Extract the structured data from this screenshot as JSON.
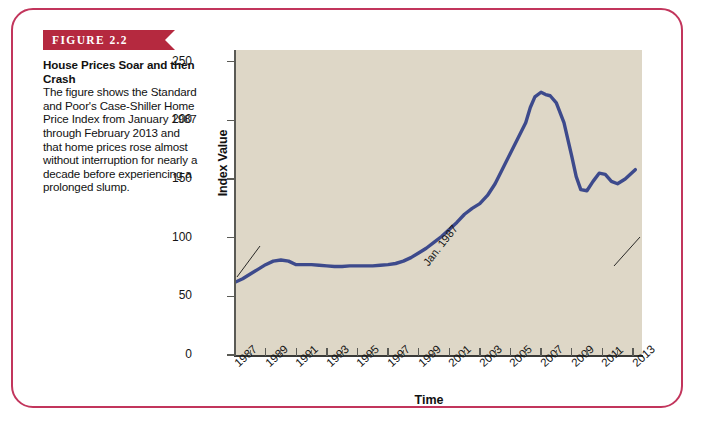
{
  "figure": {
    "banner_label": "FIGURE 2.2",
    "title": "House Prices Soar and then Crash",
    "body": "The figure shows the Standard and Poor's Case-Shiller Home Price Index from January 1987 through February 2013 and that home prices rose almost without interruption for nearly a decade before experiencing a prolonged slump."
  },
  "colors": {
    "banner": "#b5293f",
    "frame": "#c2355c",
    "plot_background": "#ded7c7",
    "line": "#3d4a8c",
    "axis": "#3a3a38",
    "text": "#111111"
  },
  "chart_data": {
    "type": "line",
    "title": "House Prices Soar and then Crash",
    "xlabel": "Time",
    "ylabel": "Index Value",
    "xlim": [
      1987,
      2013.6
    ],
    "ylim": [
      0,
      260
    ],
    "yticks": [
      0,
      50,
      100,
      150,
      200,
      250
    ],
    "xticks": [
      1987,
      1989,
      1991,
      1993,
      1995,
      1997,
      1999,
      2001,
      2003,
      2005,
      2007,
      2009,
      2011,
      2013
    ],
    "grid": false,
    "legend": "none",
    "series": [
      {
        "name": "S&P/Case-Shiller Home Price Index",
        "x": [
          1987.0,
          1987.5,
          1988.0,
          1988.5,
          1989.0,
          1989.5,
          1990.0,
          1990.5,
          1991.0,
          1991.5,
          1992.0,
          1992.5,
          1993.0,
          1993.5,
          1994.0,
          1994.5,
          1995.0,
          1995.5,
          1996.0,
          1996.5,
          1997.0,
          1997.5,
          1998.0,
          1998.5,
          1999.0,
          1999.5,
          2000.0,
          2000.5,
          2001.0,
          2001.5,
          2002.0,
          2002.5,
          2003.0,
          2003.5,
          2004.0,
          2004.5,
          2005.0,
          2005.5,
          2006.0,
          2006.3,
          2006.6,
          2007.0,
          2007.3,
          2007.6,
          2008.0,
          2008.5,
          2009.0,
          2009.3,
          2009.6,
          2010.0,
          2010.4,
          2010.8,
          2011.2,
          2011.6,
          2012.0,
          2012.5,
          2013.16
        ],
        "y": [
          62,
          65,
          69,
          73,
          77,
          80,
          81,
          80,
          77,
          77,
          77,
          76.5,
          76,
          75.5,
          75.5,
          76,
          76,
          76,
          76,
          76.5,
          77,
          78,
          80,
          83,
          87,
          91,
          96,
          101,
          107,
          113,
          120,
          125,
          129,
          136,
          146,
          159,
          172,
          185,
          198,
          211,
          220,
          224,
          222,
          221,
          215,
          198,
          170,
          152,
          141,
          140,
          148,
          155,
          154,
          148,
          146,
          150,
          158
        ]
      }
    ],
    "annotations": [
      {
        "label": "Jan. 1987",
        "x": 1987.0,
        "y": 62
      },
      {
        "label": "Feb. 2013",
        "x": 2013.16,
        "y": 158
      }
    ]
  }
}
